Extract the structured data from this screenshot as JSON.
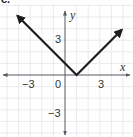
{
  "panel_label": "c.",
  "chart_data": {
    "type": "line",
    "title": "",
    "function": "y = |x - 1|",
    "xlabel": "x",
    "ylabel": "y",
    "x_tick_labels": [
      "−3",
      "0",
      "3"
    ],
    "x_tick_values": [
      -3,
      0,
      3
    ],
    "y_tick_labels": [
      "3",
      "−3"
    ],
    "y_tick_values": [
      3,
      -3
    ],
    "xlim": [
      -5.5,
      5.8
    ],
    "ylim": [
      -5.3,
      6.5
    ],
    "grid": true,
    "legend": null,
    "series": [
      {
        "name": "y = |x - 1|",
        "points": [
          [
            -4.1,
            5.1
          ],
          [
            1,
            0
          ],
          [
            4.9,
            3.9
          ]
        ],
        "arrows": "both-ends",
        "color": "#1c1c1c"
      }
    ],
    "vertex": [
      1,
      0
    ]
  },
  "colors": {
    "curve": "#1c1c1c",
    "axis": "#555a60",
    "grid": "#e3e6ea",
    "text": "#333333"
  }
}
